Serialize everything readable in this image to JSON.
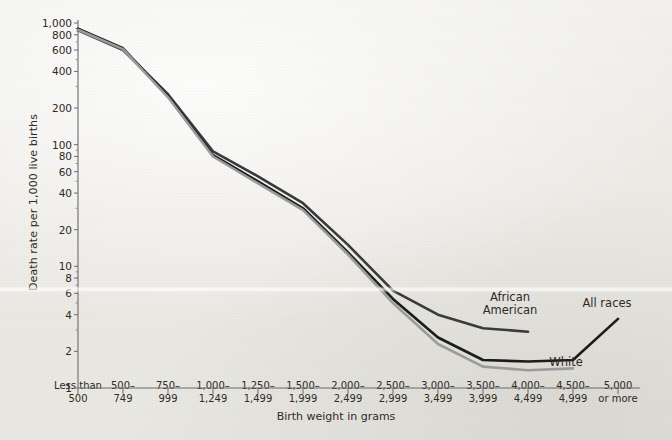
{
  "chart_data": {
    "type": "line",
    "title": "",
    "xlabel": "Birth weight in grams",
    "ylabel": "Death rate per 1,000 live births",
    "yscale": "log",
    "ylim": [
      1,
      1000
    ],
    "grid": false,
    "legend_position": "inline-right",
    "ytick_labels": [
      "1,000",
      "800",
      "600",
      "400",
      "200",
      "100",
      "80",
      "60",
      "40",
      "20",
      "10",
      "8",
      "6",
      "4",
      "2",
      "1"
    ],
    "ytick_values": [
      1000,
      800,
      600,
      400,
      200,
      100,
      80,
      60,
      40,
      20,
      10,
      8,
      6,
      4,
      2,
      1
    ],
    "categories": [
      "Less than 500",
      "500–749",
      "750–999",
      "1,000–1,249",
      "1,250–1,499",
      "1,500–1,999",
      "2,000–2,499",
      "2,500–2,999",
      "3,000–3,499",
      "3,500–3,999",
      "4,000–4,499",
      "4,500–4,999",
      "5,000 or more"
    ],
    "category_lines": [
      [
        "Less than",
        "500"
      ],
      [
        "500–",
        "749"
      ],
      [
        "750–",
        "999"
      ],
      [
        "1,000–",
        "1,249"
      ],
      [
        "1,250–",
        "1,499"
      ],
      [
        "1,500–",
        "1,999"
      ],
      [
        "2,000–",
        "2,499"
      ],
      [
        "2,500–",
        "2,999"
      ],
      [
        "3,000–",
        "3,499"
      ],
      [
        "3,500–",
        "3,999"
      ],
      [
        "4,000–",
        "4,499"
      ],
      [
        "4,500–",
        "4,999"
      ],
      [
        "5,000",
        "or more"
      ]
    ],
    "series": [
      {
        "name": "African American",
        "color": "#3a3a3c",
        "values": [
          870,
          600,
          260,
          88,
          55,
          33,
          15,
          6.3,
          4.0,
          3.1,
          2.9,
          null,
          null
        ]
      },
      {
        "name": "All races",
        "color": "#1b1b1b",
        "values": [
          900,
          620,
          250,
          82,
          50,
          30,
          13,
          5.4,
          2.6,
          1.7,
          1.65,
          1.7,
          3.7
        ]
      },
      {
        "name": "White",
        "color": "#9b9b9b",
        "values": [
          880,
          610,
          245,
          80,
          48,
          29,
          12.5,
          5.0,
          2.3,
          1.5,
          1.4,
          1.45,
          null
        ]
      }
    ],
    "annotations": [
      {
        "text": "African American",
        "lines": [
          "African",
          "American"
        ],
        "x_px": 510,
        "y_px": 291
      },
      {
        "text": "All races",
        "lines": [
          "All races"
        ],
        "x_px": 607,
        "y_px": 297
      },
      {
        "text": "White",
        "lines": [
          "White"
        ],
        "x_px": 566,
        "y_px": 356
      }
    ]
  }
}
